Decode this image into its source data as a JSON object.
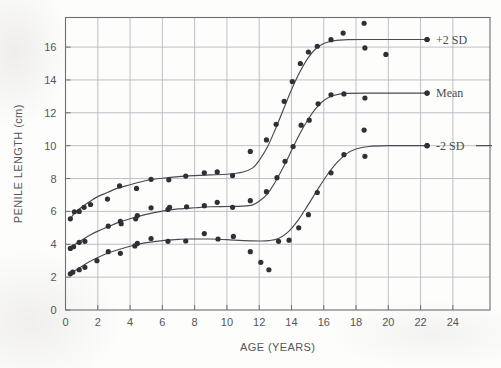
{
  "figure": {
    "background_color": "#fdfdfc",
    "ink_color": "#2f2f34",
    "grid_color": "#b9b9bd",
    "frame_color": "#6e6e74"
  },
  "axes": {
    "x_title": "AGE (YEARS)",
    "y_title": "PENILE LENGTH (cm)",
    "x_ticks": [
      "0",
      "2",
      "4",
      "6",
      "8",
      "10",
      "12",
      "14",
      "16",
      "18",
      "20",
      "22",
      "24"
    ],
    "y_ticks": [
      "0",
      "2",
      "4",
      "6",
      "8",
      "10",
      "12",
      "14",
      "16"
    ]
  },
  "legend": {
    "items": [
      {
        "label": "+2 SD"
      },
      {
        "label": "Mean"
      },
      {
        "label": "-2 SD"
      }
    ]
  },
  "chart_data": {
    "type": "scatter",
    "title": "",
    "subtitle": "",
    "xlabel": "AGE (YEARS)",
    "ylabel": "PENILE LENGTH (cm)",
    "xlim": [
      0,
      26.3
    ],
    "ylim": [
      0,
      17.8
    ],
    "xticks": [
      0,
      2,
      4,
      6,
      8,
      10,
      12,
      14,
      16,
      18,
      20,
      22,
      24
    ],
    "yticks": [
      0,
      2,
      4,
      6,
      8,
      10,
      12,
      14,
      16
    ],
    "grid": true,
    "grid_spacing": {
      "x": 2,
      "y": 2
    },
    "legend_position": "right-inline-at-curve-ends",
    "series": [
      {
        "name": "+2 SD",
        "kind": "fitted-sigmoid-curve",
        "curve": [
          [
            0.3,
            5.55
          ],
          [
            0.6,
            5.95
          ],
          [
            1.0,
            6.25
          ],
          [
            1.5,
            6.6
          ],
          [
            2.0,
            6.9
          ],
          [
            2.6,
            7.15
          ],
          [
            3.2,
            7.4
          ],
          [
            4.0,
            7.62
          ],
          [
            5.0,
            7.88
          ],
          [
            6.0,
            8.02
          ],
          [
            7.0,
            8.12
          ],
          [
            8.0,
            8.18
          ],
          [
            9.0,
            8.22
          ],
          [
            10.0,
            8.26
          ],
          [
            11.0,
            8.4
          ],
          [
            11.6,
            8.65
          ],
          [
            12.0,
            9.1
          ],
          [
            12.5,
            9.9
          ],
          [
            13.0,
            11.0
          ],
          [
            13.5,
            12.2
          ],
          [
            14.0,
            13.4
          ],
          [
            14.5,
            14.45
          ],
          [
            15.0,
            15.3
          ],
          [
            15.5,
            15.9
          ],
          [
            16.0,
            16.22
          ],
          [
            16.6,
            16.38
          ],
          [
            17.5,
            16.45
          ],
          [
            19.0,
            16.46
          ],
          [
            21.0,
            16.46
          ],
          [
            22.4,
            16.46
          ]
        ],
        "points": [
          [
            0.3,
            5.55
          ],
          [
            0.55,
            5.98
          ],
          [
            0.85,
            6.0
          ],
          [
            1.15,
            6.25
          ],
          [
            1.55,
            6.42
          ],
          [
            2.6,
            6.75
          ],
          [
            3.35,
            7.55
          ],
          [
            4.4,
            7.4
          ],
          [
            5.3,
            7.95
          ],
          [
            6.4,
            7.92
          ],
          [
            7.45,
            8.15
          ],
          [
            8.6,
            8.35
          ],
          [
            9.4,
            8.4
          ],
          [
            10.35,
            8.18
          ],
          [
            11.45,
            9.65
          ],
          [
            12.45,
            10.35
          ],
          [
            13.05,
            11.3
          ],
          [
            13.55,
            12.7
          ],
          [
            14.05,
            13.9
          ],
          [
            14.55,
            15.0
          ],
          [
            15.05,
            15.7
          ],
          [
            15.6,
            16.05
          ],
          [
            16.45,
            16.45
          ],
          [
            17.2,
            16.85
          ],
          [
            18.5,
            17.45
          ],
          [
            18.55,
            15.95
          ],
          [
            19.85,
            15.55
          ],
          [
            22.4,
            16.46
          ]
        ]
      },
      {
        "name": "Mean",
        "kind": "fitted-sigmoid-curve",
        "curve": [
          [
            0.3,
            3.75
          ],
          [
            0.6,
            4.0
          ],
          [
            1.0,
            4.25
          ],
          [
            1.5,
            4.55
          ],
          [
            2.0,
            4.8
          ],
          [
            2.6,
            5.05
          ],
          [
            3.2,
            5.3
          ],
          [
            4.0,
            5.55
          ],
          [
            5.0,
            5.82
          ],
          [
            6.0,
            6.02
          ],
          [
            7.0,
            6.15
          ],
          [
            8.0,
            6.22
          ],
          [
            9.0,
            6.28
          ],
          [
            10.0,
            6.3
          ],
          [
            11.0,
            6.32
          ],
          [
            11.6,
            6.4
          ],
          [
            12.0,
            6.62
          ],
          [
            12.5,
            7.05
          ],
          [
            13.0,
            7.8
          ],
          [
            13.5,
            8.7
          ],
          [
            14.0,
            9.7
          ],
          [
            14.5,
            10.7
          ],
          [
            15.0,
            11.55
          ],
          [
            15.5,
            12.25
          ],
          [
            16.0,
            12.75
          ],
          [
            16.6,
            13.05
          ],
          [
            17.4,
            13.18
          ],
          [
            19.0,
            13.2
          ],
          [
            21.0,
            13.2
          ],
          [
            22.4,
            13.2
          ]
        ],
        "points": [
          [
            0.3,
            3.75
          ],
          [
            0.5,
            3.85
          ],
          [
            0.85,
            4.12
          ],
          [
            1.2,
            4.18
          ],
          [
            2.65,
            5.1
          ],
          [
            3.4,
            5.4
          ],
          [
            3.45,
            5.25
          ],
          [
            4.35,
            5.55
          ],
          [
            4.45,
            5.75
          ],
          [
            5.3,
            6.22
          ],
          [
            6.35,
            6.12
          ],
          [
            6.45,
            6.25
          ],
          [
            7.5,
            6.28
          ],
          [
            8.6,
            6.35
          ],
          [
            9.4,
            6.55
          ],
          [
            10.35,
            6.25
          ],
          [
            11.45,
            6.65
          ],
          [
            12.45,
            7.2
          ],
          [
            13.1,
            8.05
          ],
          [
            13.6,
            9.05
          ],
          [
            14.1,
            9.95
          ],
          [
            14.6,
            11.25
          ],
          [
            15.1,
            11.55
          ],
          [
            15.65,
            12.55
          ],
          [
            16.45,
            13.1
          ],
          [
            17.25,
            13.15
          ],
          [
            18.55,
            12.9
          ],
          [
            22.4,
            13.2
          ]
        ]
      },
      {
        "name": "-2 SD",
        "kind": "fitted-sigmoid-curve",
        "curve": [
          [
            0.3,
            2.2
          ],
          [
            0.6,
            2.4
          ],
          [
            1.0,
            2.65
          ],
          [
            1.5,
            2.95
          ],
          [
            2.0,
            3.2
          ],
          [
            2.6,
            3.45
          ],
          [
            3.2,
            3.65
          ],
          [
            4.0,
            3.88
          ],
          [
            5.0,
            4.1
          ],
          [
            6.0,
            4.22
          ],
          [
            7.0,
            4.3
          ],
          [
            8.0,
            4.32
          ],
          [
            9.0,
            4.32
          ],
          [
            10.0,
            4.28
          ],
          [
            11.0,
            4.22
          ],
          [
            12.0,
            4.2
          ],
          [
            12.6,
            4.22
          ],
          [
            13.2,
            4.35
          ],
          [
            13.8,
            4.75
          ],
          [
            14.4,
            5.45
          ],
          [
            15.0,
            6.35
          ],
          [
            15.6,
            7.3
          ],
          [
            16.2,
            8.2
          ],
          [
            16.8,
            8.95
          ],
          [
            17.4,
            9.5
          ],
          [
            18.0,
            9.8
          ],
          [
            18.8,
            9.95
          ],
          [
            20.0,
            10.0
          ],
          [
            21.5,
            10.0
          ],
          [
            22.4,
            10.0
          ]
        ],
        "points": [
          [
            0.3,
            2.2
          ],
          [
            0.45,
            2.3
          ],
          [
            0.85,
            2.45
          ],
          [
            1.2,
            2.6
          ],
          [
            1.95,
            3.0
          ],
          [
            2.65,
            3.55
          ],
          [
            3.4,
            3.45
          ],
          [
            4.3,
            3.9
          ],
          [
            4.45,
            4.05
          ],
          [
            5.3,
            4.35
          ],
          [
            6.35,
            4.18
          ],
          [
            7.45,
            4.2
          ],
          [
            8.6,
            4.65
          ],
          [
            9.45,
            4.32
          ],
          [
            10.4,
            4.48
          ],
          [
            11.45,
            3.55
          ],
          [
            12.1,
            2.9
          ],
          [
            12.6,
            2.45
          ],
          [
            13.2,
            4.18
          ],
          [
            13.85,
            4.25
          ],
          [
            14.45,
            5.0
          ],
          [
            15.05,
            5.8
          ],
          [
            15.6,
            7.15
          ],
          [
            16.45,
            8.35
          ],
          [
            17.25,
            9.45
          ],
          [
            18.5,
            10.95
          ],
          [
            18.55,
            9.35
          ],
          [
            22.4,
            10.0
          ]
        ]
      }
    ]
  }
}
